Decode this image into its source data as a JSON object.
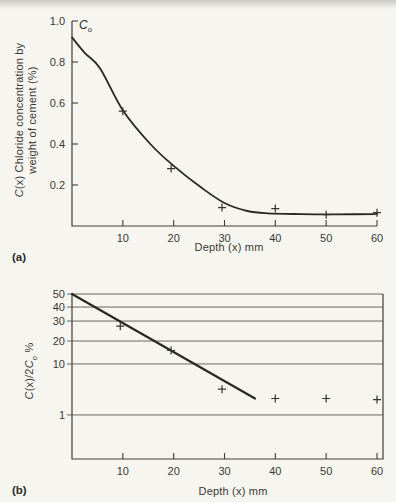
{
  "page": {
    "background": "#f6f5f0",
    "ink": "#37342f"
  },
  "panel_a": {
    "label": "(a)",
    "xlabel": "Depth (x) mm",
    "ylabel": {
      "c": "C",
      "rest": "(x) Chloride concentration by",
      "line2": "weight of cement (%)"
    },
    "annotation": {
      "c": "C",
      "sub": "o"
    }
  },
  "panel_b": {
    "label": "(b)",
    "xlabel": "Depth (x) mm",
    "ylabel": {
      "c1": "C",
      "mid": "(x)/2",
      "c2": "C",
      "sub": "o",
      "suffix": " %"
    }
  },
  "chart_data": [
    {
      "type": "line",
      "panel": "a",
      "title": "",
      "xlabel": "Depth (x) mm",
      "ylabel": "C(x) Chloride concentration by weight of cement (%)",
      "annotation": "Co (initial surface concentration, curve starts at 0.92)",
      "xlim": [
        0,
        60
      ],
      "ylim": [
        0,
        1.0
      ],
      "y_scale": "linear",
      "grid": false,
      "x_ticks": [
        10,
        20,
        30,
        40,
        50,
        60
      ],
      "x_tick_labels": [
        "10",
        "20",
        "30",
        "40",
        "50",
        "60"
      ],
      "y_ticks": [
        0.2,
        0.4,
        0.6,
        0.8,
        1.0
      ],
      "y_tick_labels": [
        "0.2",
        "0.4",
        "0.6",
        "0.8",
        "1.0"
      ],
      "curve_points": [
        [
          0,
          0.92
        ],
        [
          2.5,
          0.845
        ],
        [
          5.5,
          0.77
        ],
        [
          10,
          0.565
        ],
        [
          15.4,
          0.4
        ],
        [
          20,
          0.293
        ],
        [
          25.3,
          0.19
        ],
        [
          30,
          0.112
        ],
        [
          34.5,
          0.073
        ],
        [
          38.5,
          0.062
        ],
        [
          45,
          0.058
        ],
        [
          52,
          0.057
        ],
        [
          60,
          0.058
        ]
      ],
      "data_points_x": [
        10,
        19.5,
        29.5,
        40,
        50,
        60
      ],
      "data_points_y": [
        0.56,
        0.28,
        0.09,
        0.085,
        0.055,
        0.065
      ]
    },
    {
      "type": "scatter",
      "panel": "b",
      "title": "",
      "xlabel": "Depth (x) mm",
      "ylabel": "C(x)/2Co %",
      "xlim": [
        0,
        61.5
      ],
      "y_scale": "log",
      "grid": "horizontal",
      "x_ticks": [
        10,
        20,
        30,
        40,
        50,
        60
      ],
      "x_tick_labels": [
        "10",
        "20",
        "30",
        "40",
        "50",
        "60"
      ],
      "y_ticks": [
        50,
        40,
        30,
        20,
        10,
        1
      ],
      "y_tick_labels": [
        "50",
        "40",
        "30",
        "20",
        "10",
        "1"
      ],
      "y_tick_fractions": [
        0,
        0.079,
        0.164,
        0.285,
        0.424,
        0.733
      ],
      "fit_line": {
        "x": [
          0,
          36
        ],
        "y": [
          50,
          2.1
        ]
      },
      "data_points_x": [
        9.5,
        19.5,
        29.5,
        40,
        50,
        60
      ],
      "data_points_y": [
        27,
        15,
        3.2,
        2.1,
        2.1,
        2.0
      ]
    }
  ]
}
